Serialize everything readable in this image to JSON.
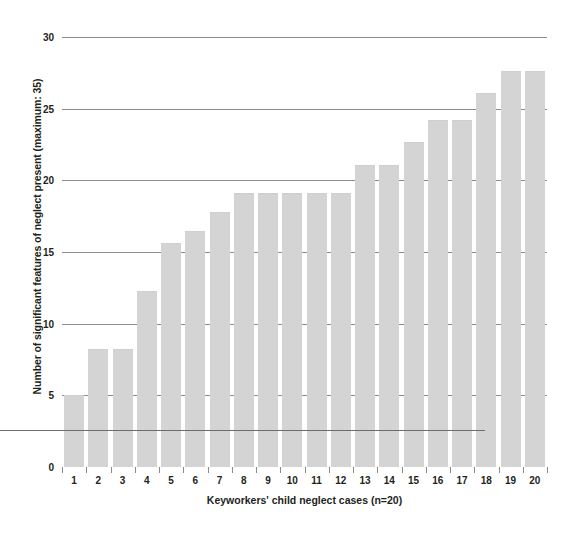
{
  "chart_data": {
    "type": "bar",
    "title": "",
    "xlabel": "Keyworkers' child neglect cases (n=20)",
    "ylabel": "Number of significant features of neglect present (maximum: 35)",
    "categories": [
      "1",
      "2",
      "3",
      "4",
      "5",
      "6",
      "7",
      "8",
      "9",
      "10",
      "11",
      "12",
      "13",
      "14",
      "15",
      "16",
      "17",
      "18",
      "19",
      "20"
    ],
    "values": [
      5.0,
      8.2,
      8.2,
      12.3,
      15.6,
      16.5,
      17.8,
      19.1,
      19.1,
      19.1,
      19.1,
      19.1,
      21.1,
      21.1,
      22.7,
      24.2,
      24.2,
      26.1,
      27.6,
      27.6
    ],
    "ylim": [
      0,
      30
    ],
    "ytick_labels": [
      "0",
      "5",
      "10",
      "15",
      "20",
      "25",
      "30"
    ],
    "ytick_values": [
      0,
      5,
      10,
      15,
      20,
      25,
      30
    ],
    "grid": true,
    "legend": null,
    "bar_color": "#d4d4d4",
    "gridline_color": "#8c8c8c",
    "text_color": "#231f20",
    "background_color": "#ffffff"
  }
}
